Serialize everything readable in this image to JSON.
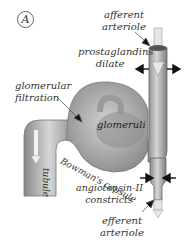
{
  "panel_label": "A",
  "labels": {
    "afferent_arteriole": [
      "afferent",
      "arteriole"
    ],
    "prostaglandins": [
      "prostaglandins",
      "dilate"
    ],
    "glomerular_filtration": [
      "glomerular",
      "filtration"
    ],
    "glomeruli": "glomeruli",
    "bowmans_capsule": "Bowman's capsule",
    "tubule": "tubule",
    "angiotensin": [
      "angiotensin-II",
      "constricts"
    ],
    "efferent_arteriole": [
      "efferent",
      "arteriole"
    ]
  },
  "colors": {
    "structure_fill": "#b8b8b8",
    "structure_dark": "#7a7a7a",
    "arrow": "#111111",
    "text": "#333333"
  }
}
